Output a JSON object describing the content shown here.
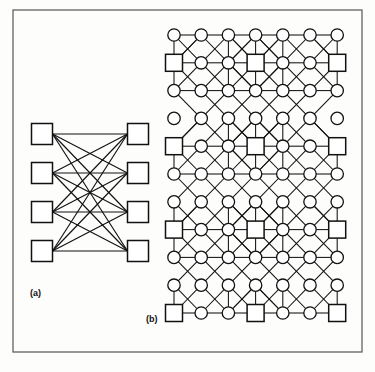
{
  "figure": {
    "background_color": "#fdfdfc",
    "ink_color": "#111111",
    "frame": {
      "name": "outer-border",
      "x": 13,
      "y": 10,
      "width": 349,
      "height": 342,
      "stroke": "#555555",
      "stroke_width": 1.2
    },
    "panels": [
      {
        "id": "a",
        "label": "(a)",
        "label_x": 30,
        "label_y": 296,
        "caption": "complete bipartite graph K4,4",
        "type": "bipartite",
        "node_shape": "square",
        "node_size": 21,
        "left_column_x": 42,
        "right_column_x": 138,
        "row_ys": [
          134,
          173,
          212,
          251
        ],
        "left_nodes": [
          "L1",
          "L2",
          "L3",
          "L4"
        ],
        "right_nodes": [
          "R1",
          "R2",
          "R3",
          "R4"
        ],
        "edge_count": 16,
        "edges_all_pairs": true
      },
      {
        "id": "b",
        "label": "(b)",
        "label_x": 146,
        "label_y": 322,
        "caption": "multistage mesh network with square switch nodes",
        "type": "mesh",
        "origin_x": 174,
        "origin_y": 35,
        "col_step": 27.2,
        "row_step": 27.8,
        "cols": 7,
        "rows": 11,
        "circle_radius": 6.2,
        "square_size": 17,
        "square_positions": [
          [
            1,
            0
          ],
          [
            1,
            3
          ],
          [
            1,
            6
          ],
          [
            4,
            0
          ],
          [
            4,
            3
          ],
          [
            4,
            6
          ],
          [
            7,
            0
          ],
          [
            7,
            3
          ],
          [
            7,
            6
          ],
          [
            10,
            0
          ],
          [
            10,
            3
          ],
          [
            10,
            6
          ]
        ],
        "isolated_rows": [
          3
        ],
        "isolated_cols": [
          0,
          6
        ]
      }
    ]
  }
}
